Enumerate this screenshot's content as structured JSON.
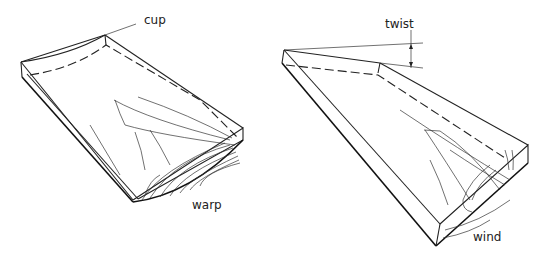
{
  "diagram": {
    "left_board": {
      "labels": {
        "top": "cup",
        "bottom": "warp"
      }
    },
    "right_board": {
      "labels": {
        "top": "twist",
        "bottom": "wind"
      }
    },
    "colors": {
      "line": "#222222",
      "background": "#ffffff"
    }
  }
}
